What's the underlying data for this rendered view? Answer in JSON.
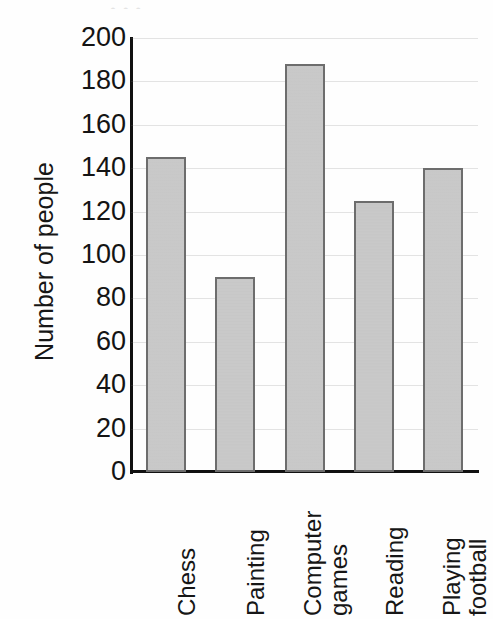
{
  "chart_data": {
    "type": "bar",
    "title": "",
    "xlabel": "",
    "ylabel": "Number of people",
    "categories": [
      "Chess",
      "Painting",
      "Computer games",
      "Reading",
      "Playing football"
    ],
    "category_lines": [
      [
        "Chess"
      ],
      [
        "Painting"
      ],
      [
        "Computer",
        "games"
      ],
      [
        "Reading"
      ],
      [
        "Playing",
        "football"
      ]
    ],
    "values": [
      145,
      90,
      188,
      125,
      140
    ],
    "ylim": [
      0,
      200
    ],
    "ytick_step": 20,
    "ytick_labels": [
      "200",
      "180",
      "160",
      "140",
      "120",
      "100",
      "80",
      "60",
      "40",
      "20",
      "0"
    ],
    "ytick_values": [
      200,
      180,
      160,
      140,
      120,
      100,
      80,
      60,
      40,
      20,
      0
    ],
    "grid": true,
    "grid_axis": "y",
    "legend": false,
    "bar_fill_color": "#c9c9c9",
    "bar_border_color": "#6d6d6d",
    "axis_color": "#111111",
    "background_color": "#ffffff",
    "label_rotation": -90
  },
  "figure": {
    "title_remnant": "•      •                    •"
  }
}
